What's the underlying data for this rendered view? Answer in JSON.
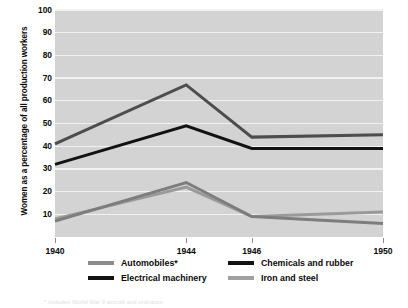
{
  "chart_data": {
    "type": "line",
    "title": "",
    "xlabel": "",
    "ylabel": "Women as a percentage of all production workers",
    "x": [
      1940,
      1944,
      1946,
      1950
    ],
    "xtick_labels": [
      "1940",
      "1944",
      "1946",
      "1950"
    ],
    "ytick_labels": [
      "10",
      "20",
      "30",
      "40",
      "50",
      "60",
      "70",
      "80",
      "90",
      "100"
    ],
    "yticks": [
      10,
      20,
      30,
      40,
      50,
      60,
      70,
      80,
      90,
      100
    ],
    "ylim": [
      0,
      100
    ],
    "xlim": [
      1940,
      1950
    ],
    "grid": "horizontal",
    "legend_position": "bottom",
    "plot_background": "#d3d3d3",
    "gridline_color": "#f2f2f2",
    "series": [
      {
        "name": "Automobiles*",
        "color": "#4d4d4d",
        "legend_swatch_color": "#8c8c8c",
        "values": [
          41,
          67,
          44,
          45
        ]
      },
      {
        "name": "Electrical machinery",
        "color": "#9a9a9a",
        "legend_swatch_color": "#121212",
        "values": [
          8,
          22,
          9,
          11
        ]
      },
      {
        "name": "Chemicals and rubber",
        "color": "#121212",
        "legend_swatch_color": "#121212",
        "values": [
          32,
          49,
          39,
          39
        ]
      },
      {
        "name": "Iron and steel",
        "color": "#7d7d7d",
        "legend_swatch_color": "#a0a0a0",
        "values": [
          7,
          24,
          9,
          6
        ]
      }
    ]
  },
  "footnote": "* Includes World War II aircraft and ordnance"
}
